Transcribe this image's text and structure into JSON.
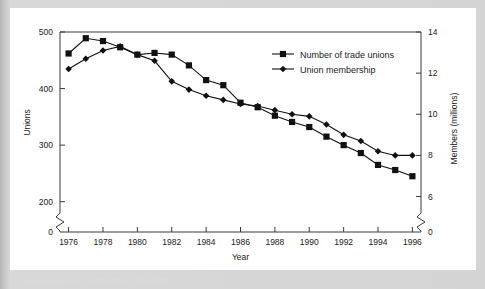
{
  "panel": {
    "caption": "Trade unions and membership, 1976-1996"
  },
  "chart_data": {
    "type": "line",
    "title": "",
    "xlabel": "Year",
    "ylabel": "Unions",
    "y2label": "Members (millions)",
    "grid": false,
    "legend_position": "top-right",
    "axis_break_left": true,
    "axis_break_right": true,
    "x": [
      1976,
      1977,
      1978,
      1979,
      1980,
      1981,
      1982,
      1983,
      1984,
      1985,
      1986,
      1987,
      1988,
      1989,
      1990,
      1991,
      1992,
      1993,
      1994,
      1995,
      1996
    ],
    "xticklabels": [
      "1976",
      "1978",
      "1980",
      "1982",
      "1984",
      "1986",
      "1988",
      "1990",
      "1992",
      "1994",
      "1996"
    ],
    "xlim": [
      1975.5,
      1996.5
    ],
    "ylim": [
      180,
      500
    ],
    "yticks": [
      0,
      200,
      300,
      400,
      500
    ],
    "yticklabels": [
      "0",
      "200",
      "300",
      "400",
      "500"
    ],
    "y2lim": [
      5.2,
      14.0
    ],
    "y2ticks": [
      0,
      6,
      8,
      10,
      12,
      14
    ],
    "y2ticklabels": [
      "0",
      "6",
      "8",
      "10",
      "12",
      "14"
    ],
    "series": [
      {
        "name": "Number of trade unions",
        "marker": "square",
        "axis": "left",
        "color": "#111111",
        "values": [
          462,
          489,
          484,
          473,
          460,
          463,
          460,
          441,
          415,
          406,
          375,
          367,
          352,
          341,
          332,
          315,
          300,
          286,
          265,
          256,
          245
        ]
      },
      {
        "name": "Union membership",
        "marker": "diamond",
        "axis": "right",
        "color": "#111111",
        "values": [
          12.2,
          12.7,
          13.1,
          13.3,
          12.9,
          12.6,
          11.6,
          11.2,
          10.9,
          10.7,
          10.5,
          10.4,
          10.2,
          10.0,
          9.9,
          9.5,
          9.0,
          8.7,
          8.2,
          8.0,
          8.0
        ]
      }
    ],
    "legend": [
      {
        "label": "Number of trade unions",
        "marker": "square"
      },
      {
        "label": "Union membership",
        "marker": "diamond"
      }
    ]
  }
}
